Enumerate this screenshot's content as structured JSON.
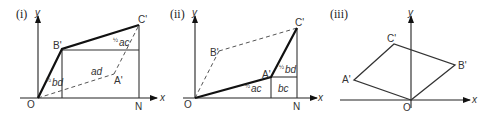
{
  "figure": {
    "panels": [
      {
        "id": "i",
        "label": "(i)",
        "axes": {
          "x": "x",
          "y": "y"
        },
        "points": {
          "O": "O",
          "A": "A'",
          "B": "B'",
          "C": "C'",
          "N": "N"
        },
        "areas": {
          "half_bd": "bd",
          "ad": "ad",
          "half_ac": "ac"
        },
        "half": "1/2"
      },
      {
        "id": "ii",
        "label": "(ii)",
        "axes": {
          "x": "x",
          "y": "y"
        },
        "points": {
          "O": "O",
          "A": "A'",
          "B": "B'",
          "C": "C'",
          "N": "N"
        },
        "areas": {
          "half_ac": "ac",
          "bc": "bc",
          "half_bd": "bd"
        },
        "half": "1/2"
      },
      {
        "id": "iii",
        "label": "(iii)",
        "axes": {
          "x": "x",
          "y": "y"
        },
        "points": {
          "O": "O",
          "A": "A'",
          "B": "B'",
          "C": "C'"
        }
      }
    ]
  }
}
